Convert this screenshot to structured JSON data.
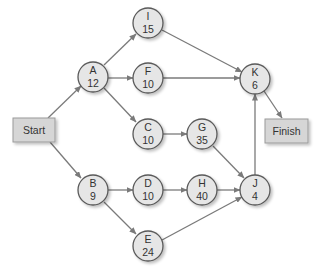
{
  "diagram": {
    "type": "network-diagram",
    "colors": {
      "node_fill": "#e6e6e6",
      "node_stroke": "#5a5a5a",
      "box_fill": "#d6d6d6",
      "box_stroke": "#9a9a9a",
      "arrow": "#7a7a7a",
      "text": "#333333"
    },
    "start": {
      "label": "Start"
    },
    "finish": {
      "label": "Finish"
    },
    "nodes": {
      "A": {
        "id": "A",
        "duration": "12"
      },
      "B": {
        "id": "B",
        "duration": "9"
      },
      "C": {
        "id": "C",
        "duration": "10"
      },
      "D": {
        "id": "D",
        "duration": "10"
      },
      "E": {
        "id": "E",
        "duration": "24"
      },
      "F": {
        "id": "F",
        "duration": "10"
      },
      "G": {
        "id": "G",
        "duration": "35"
      },
      "H": {
        "id": "H",
        "duration": "40"
      },
      "I": {
        "id": "I",
        "duration": "15"
      },
      "J": {
        "id": "J",
        "duration": "4"
      },
      "K": {
        "id": "K",
        "duration": "6"
      }
    },
    "edges": [
      [
        "Start",
        "A"
      ],
      [
        "Start",
        "B"
      ],
      [
        "A",
        "I"
      ],
      [
        "A",
        "F"
      ],
      [
        "A",
        "C"
      ],
      [
        "B",
        "D"
      ],
      [
        "B",
        "E"
      ],
      [
        "C",
        "G"
      ],
      [
        "D",
        "H"
      ],
      [
        "I",
        "K"
      ],
      [
        "F",
        "K"
      ],
      [
        "G",
        "J"
      ],
      [
        "H",
        "J"
      ],
      [
        "E",
        "J"
      ],
      [
        "J",
        "K"
      ],
      [
        "K",
        "Finish"
      ]
    ]
  }
}
